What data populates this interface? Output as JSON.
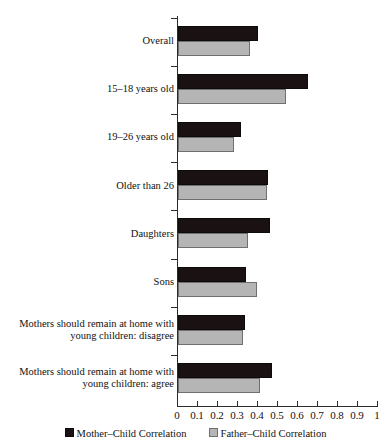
{
  "chart_data": {
    "type": "bar",
    "orientation": "horizontal",
    "title": "",
    "xlabel": "",
    "ylabel": "",
    "xlim": [
      0,
      1
    ],
    "grid": false,
    "legend_position": "bottom-center",
    "categories": [
      "Overall",
      "15–18 years old",
      "19–26 years old",
      "Older than 26",
      "Daughters",
      "Sons",
      "Mothers should remain at home with young children: disagree",
      "Mothers should remain at home with young children: agree"
    ],
    "category_lines": [
      [
        "Overall"
      ],
      [
        "15–18 years old"
      ],
      [
        "19–26 years old"
      ],
      [
        "Older than 26"
      ],
      [
        "Daughters"
      ],
      [
        "Sons"
      ],
      [
        "Mothers should remain at home with",
        "young children: disagree"
      ],
      [
        "Mothers should remain at home with",
        "young children: agree"
      ]
    ],
    "series": [
      {
        "name": "Mother–Child Correlation",
        "color": "#1a1212",
        "values": [
          0.405,
          0.655,
          0.32,
          0.455,
          0.465,
          0.345,
          0.34,
          0.475
        ]
      },
      {
        "name": "Father–Child Correlation",
        "color": "#b5b5b5",
        "values": [
          0.365,
          0.545,
          0.285,
          0.45,
          0.355,
          0.4,
          0.33,
          0.415
        ]
      }
    ],
    "xticks": [
      0,
      0.1,
      0.2,
      0.3,
      0.4,
      0.5,
      0.6,
      0.7,
      0.8,
      0.9,
      1
    ],
    "xtick_labels": [
      "0",
      "0.1",
      "0.2",
      "0.3",
      "0.4",
      "0.5",
      "0.6",
      "0.7",
      "0.8",
      "0.9",
      "1"
    ]
  },
  "legend": {
    "items": [
      {
        "label": "Mother–Child Correlation",
        "swatch": "mother"
      },
      {
        "label": "Father–Child Correlation",
        "swatch": "father"
      }
    ]
  }
}
